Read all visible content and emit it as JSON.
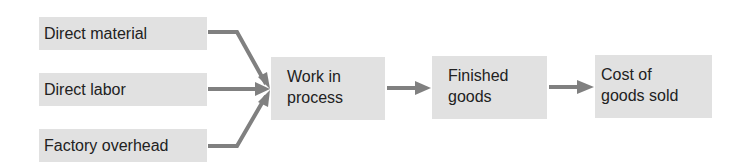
{
  "diagram": {
    "inputs": [
      {
        "id": "direct-material",
        "label": "Direct material"
      },
      {
        "id": "direct-labor",
        "label": "Direct labor"
      },
      {
        "id": "factory-overhead",
        "label": "Factory overhead"
      }
    ],
    "stages": [
      {
        "id": "work-in-process",
        "lines": [
          "Work in",
          "process"
        ]
      },
      {
        "id": "finished-goods",
        "lines": [
          "Finished",
          "goods"
        ]
      },
      {
        "id": "cost-of-goods-sold",
        "lines": [
          "Cost of",
          "goods sold"
        ]
      }
    ],
    "edges": [
      {
        "from": "direct-material",
        "to": "work-in-process"
      },
      {
        "from": "direct-labor",
        "to": "work-in-process"
      },
      {
        "from": "factory-overhead",
        "to": "work-in-process"
      },
      {
        "from": "work-in-process",
        "to": "finished-goods"
      },
      {
        "from": "finished-goods",
        "to": "cost-of-goods-sold"
      }
    ],
    "colors": {
      "box_fill": "#e1e1e1",
      "arrow": "#808080",
      "text": "#222222"
    }
  }
}
